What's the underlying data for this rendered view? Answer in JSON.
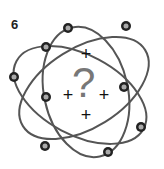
{
  "diagram": {
    "type": "atom-model",
    "label": "6",
    "nucleus": {
      "symbol": "?",
      "plus_signs": [
        "+",
        "+",
        "+",
        "+"
      ]
    },
    "electron_count": 9,
    "colors": {
      "orbit": "#555555",
      "electron_outer": "#222222",
      "electron_inner": "#aaaaaa",
      "question_mark": "#777777"
    }
  }
}
